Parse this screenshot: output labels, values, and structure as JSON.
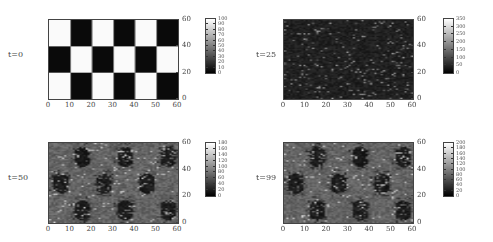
{
  "chart_data": [
    {
      "type": "heatmap",
      "label": "t=0",
      "x_ticks": [
        "0",
        "10",
        "20",
        "30",
        "40",
        "50",
        "60"
      ],
      "y_ticks": [
        "0",
        "20",
        "40",
        "60"
      ],
      "xlim": [
        0,
        60
      ],
      "ylim": [
        0,
        60
      ],
      "colorbar": {
        "ticks": [
          "0",
          "10",
          "20",
          "30",
          "40",
          "50",
          "60",
          "70",
          "80",
          "90",
          "100"
        ],
        "range": [
          0,
          100
        ]
      },
      "pattern": "checkerboard",
      "description": "3 rows x 6 columns checkerboard, cells 10 wide x 20 tall; top-left cell white (100), alternating with black (0)"
    },
    {
      "type": "heatmap",
      "label": "t=25",
      "x_ticks": [
        "0",
        "10",
        "20",
        "30",
        "40",
        "50",
        "60"
      ],
      "y_ticks": [
        "0",
        "20",
        "40",
        "60"
      ],
      "xlim": [
        0,
        60
      ],
      "ylim": [
        0,
        60
      ],
      "colorbar": {
        "ticks": [
          "0",
          "50",
          "100",
          "150",
          "200",
          "250",
          "300",
          "350"
        ],
        "range": [
          0,
          350
        ]
      },
      "pattern": "sparse-noise",
      "description": "Mostly dark (near 0) field with scattered brighter speckles"
    },
    {
      "type": "heatmap",
      "label": "t=50",
      "x_ticks": [
        "0",
        "10",
        "20",
        "30",
        "40",
        "50",
        "60"
      ],
      "y_ticks": [
        "0",
        "20",
        "40",
        "60"
      ],
      "xlim": [
        0,
        60
      ],
      "ylim": [
        0,
        60
      ],
      "colorbar": {
        "ticks": [
          "0",
          "20",
          "40",
          "60",
          "80",
          "100",
          "120",
          "140",
          "160",
          "180"
        ],
        "range": [
          0,
          180
        ]
      },
      "pattern": "grey-with-dark-blobs",
      "description": "Mid-grey field with dark blobs at former checkerboard black cells"
    },
    {
      "type": "heatmap",
      "label": "t=99",
      "x_ticks": [
        "0",
        "10",
        "20",
        "30",
        "40",
        "50",
        "60"
      ],
      "y_ticks": [
        "0",
        "20",
        "40",
        "60"
      ],
      "xlim": [
        0,
        60
      ],
      "ylim": [
        0,
        60
      ],
      "colorbar": {
        "ticks": [
          "0",
          "20",
          "40",
          "60",
          "80",
          "100",
          "120",
          "140",
          "160",
          "180",
          "200"
        ],
        "range": [
          0,
          200
        ]
      },
      "pattern": "grey-with-dark-blobs",
      "description": "Mid-grey field with dark blobs at former checkerboard black cells"
    }
  ],
  "panels": [
    {
      "label": "t=0"
    },
    {
      "label": "t=25"
    },
    {
      "label": "t=50"
    },
    {
      "label": "t=99"
    }
  ]
}
